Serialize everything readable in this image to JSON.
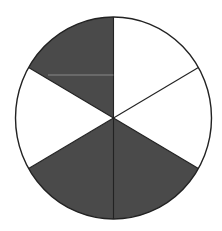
{
  "diagram": {
    "type": "fraction-circle",
    "total_parts": 6,
    "shaded_parts": 3,
    "fraction_shaded": "3/6",
    "colors": {
      "shaded": "#4a4a4a",
      "unshaded": "#ffffff",
      "outline": "#222222",
      "background": "#ffffff",
      "faint_line": "#9a9a9a"
    },
    "geometry": {
      "cx": 113.5,
      "cy": 118,
      "rx": 98,
      "ry": 101
    },
    "sectors": [
      {
        "index": 0,
        "position": "top-right",
        "start_deg": -90,
        "end_deg": -30,
        "shaded": false
      },
      {
        "index": 1,
        "position": "right",
        "start_deg": -30,
        "end_deg": 30,
        "shaded": false
      },
      {
        "index": 2,
        "position": "bottom-right",
        "start_deg": 30,
        "end_deg": 90,
        "shaded": true
      },
      {
        "index": 3,
        "position": "bottom-left",
        "start_deg": 90,
        "end_deg": 150,
        "shaded": true
      },
      {
        "index": 4,
        "position": "left",
        "start_deg": 150,
        "end_deg": 210,
        "shaded": false
      },
      {
        "index": 5,
        "position": "top-left",
        "start_deg": 210,
        "end_deg": 270,
        "shaded": true
      }
    ],
    "faint_line": {
      "x1": 48,
      "y1": 75,
      "x2": 113.5,
      "y2": 75
    }
  }
}
